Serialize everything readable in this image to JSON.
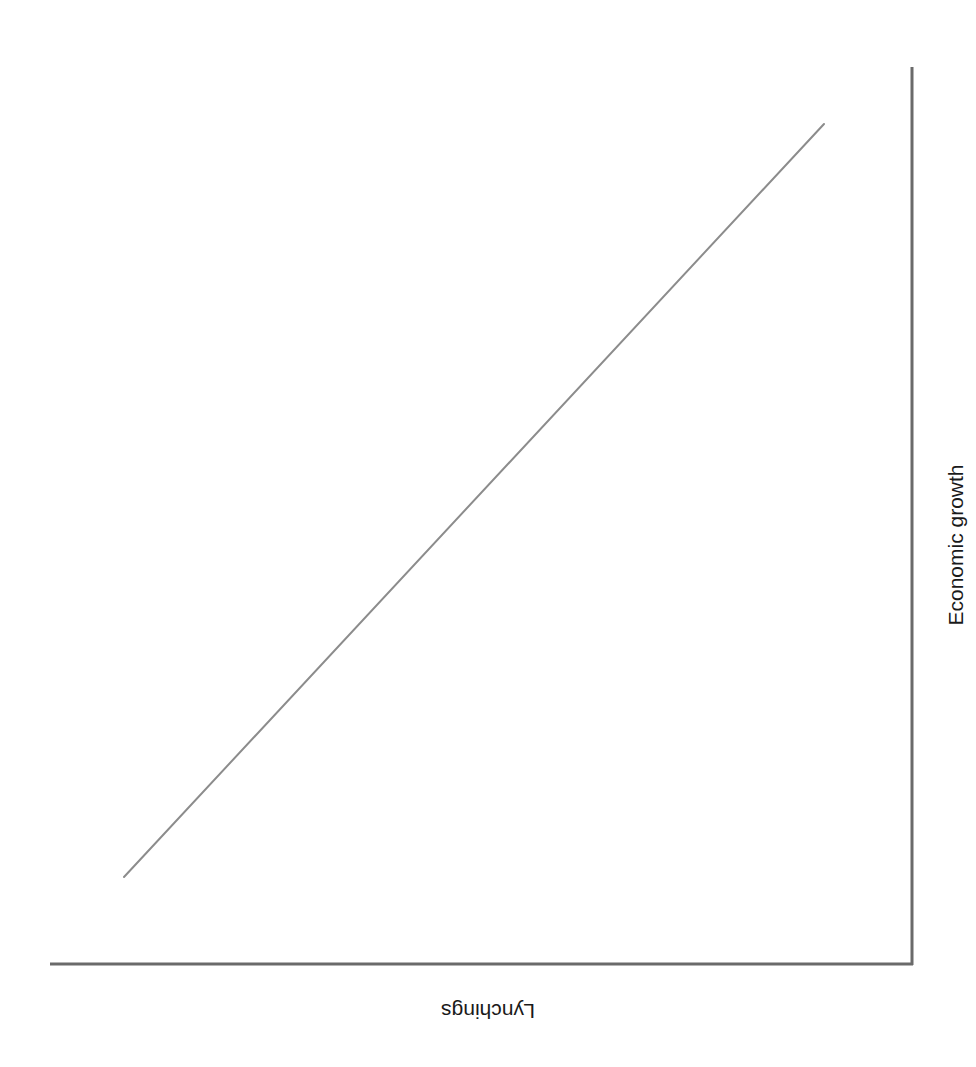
{
  "figure": {
    "width": 976,
    "height": 1067,
    "background": "#ffffff"
  },
  "chart_data": {
    "type": "line",
    "title": "",
    "subtitle": "",
    "xlabel": "Lynchings",
    "ylabel": "Economic growth",
    "x": [
      0,
      100
    ],
    "series": [
      {
        "name": "trend",
        "values": [
          0,
          100
        ],
        "color": "#8c8c8c",
        "linewidth": 2
      }
    ],
    "xlim": [
      0,
      100
    ],
    "ylim": [
      0,
      100
    ],
    "grid": false,
    "legend": false,
    "xticks": [],
    "yticks": [],
    "xticklabels": [],
    "yticklabels": [],
    "annotations": []
  },
  "axes": {
    "color": "#6a6a6a",
    "linewidth": 3,
    "x_axis_label": "Lynchings",
    "y_axis_label": "Economic growth",
    "x_axis_rotation": "180",
    "y_axis_rotation": "-90",
    "y_axis_side": "right",
    "x_start_px": 50,
    "x_end_px": 912,
    "x_y_px": 964,
    "y_top_px": 68,
    "y_bottom_px": 964,
    "y_x_px": 912
  },
  "trendline": {
    "color": "#8c8c8c",
    "linewidth": 2,
    "x1_px": 124,
    "y1_px": 877,
    "x2_px": 824,
    "y2_px": 124
  }
}
